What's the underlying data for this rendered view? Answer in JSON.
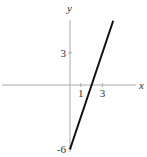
{
  "chart_data": {
    "type": "line",
    "title": "",
    "xlabel": "x",
    "ylabel": "y",
    "xlim": [
      -6.5,
      7.3
    ],
    "ylim": [
      -6.6,
      7.8
    ],
    "x_ticks": [
      1,
      3
    ],
    "x_tick_labels": [
      "1",
      "3"
    ],
    "y_ticks": [
      3,
      -6
    ],
    "y_tick_labels": [
      "3",
      "-6"
    ],
    "grid": false,
    "series": [
      {
        "name": "y = 3x - 6",
        "x": [
          0,
          4
        ],
        "y": [
          -6,
          6
        ],
        "color": "#111111"
      }
    ]
  }
}
